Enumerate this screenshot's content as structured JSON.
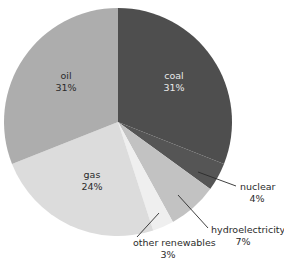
{
  "chart_data": {
    "type": "pie",
    "title": "",
    "subtitle": "",
    "xlabel": "",
    "ylabel": "",
    "legend_position": "none",
    "grid": false,
    "start_angle_deg": 0,
    "direction": "clockwise",
    "categories": [
      "coal",
      "nuclear",
      "hydroelectricity",
      "other renewables",
      "gas",
      "oil"
    ],
    "values": [
      31,
      4,
      7,
      3,
      24,
      31
    ],
    "unit": "%",
    "slices": [
      {
        "name": "coal",
        "label": "coal",
        "value": 31,
        "value_text": "31%",
        "color": "#4e4e4e",
        "label_placement": "inside",
        "label_text_color": "#e9e9e9"
      },
      {
        "name": "nuclear",
        "label": "nuclear",
        "value": 4,
        "value_text": "4%",
        "color": "#555555",
        "label_placement": "outside",
        "label_text_color": "#2b2b2b"
      },
      {
        "name": "hydroelectricity",
        "label": "hydroelectricity",
        "value": 7,
        "value_text": "7%",
        "color": "#c2c2c2",
        "label_placement": "outside",
        "label_text_color": "#2b2b2b"
      },
      {
        "name": "other renewables",
        "label": "other renewables",
        "value": 3,
        "value_text": "3%",
        "color": "#efefef",
        "label_placement": "outside",
        "label_text_color": "#2b2b2b"
      },
      {
        "name": "gas",
        "label": "gas",
        "value": 24,
        "value_text": "24%",
        "color": "#dcdcdc",
        "label_placement": "inside",
        "label_text_color": "#2b2b2b"
      },
      {
        "name": "oil",
        "label": "oil",
        "value": 31,
        "value_text": "31%",
        "color": "#adadad",
        "label_placement": "inside",
        "label_text_color": "#2b2b2b"
      }
    ]
  },
  "labels": {
    "coal_name": "coal",
    "coal_value": "31%",
    "oil_name": "oil",
    "oil_value": "31%",
    "gas_name": "gas",
    "gas_value": "24%",
    "nuclear_name": "nuclear",
    "nuclear_value": "4%",
    "hydro_name": "hydroelectricity",
    "hydro_value": "7%",
    "renew_name": "other renewables",
    "renew_value": "3%"
  },
  "colors": {
    "background": "#ffffff",
    "coal": "#4e4e4e",
    "nuclear": "#555555",
    "hydro": "#c2c2c2",
    "renewables": "#efefef",
    "gas": "#dcdcdc",
    "oil": "#adadad",
    "text_dark": "#2b2b2b",
    "text_light": "#e9e9e9",
    "leader_line": "#2b2b2b"
  }
}
